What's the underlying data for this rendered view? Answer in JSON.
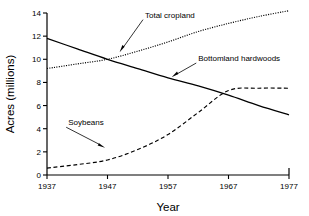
{
  "chart_data": {
    "type": "line",
    "title": "",
    "xlabel": "Year",
    "ylabel": "Acres (millions)",
    "xlim": [
      1937,
      1977
    ],
    "ylim": [
      0,
      14
    ],
    "xticks": [
      1937,
      1947,
      1957,
      1967,
      1977
    ],
    "yticks": [
      0,
      2,
      4,
      6,
      8,
      10,
      12,
      14
    ],
    "grid": false,
    "legend": "none (inline annotations with leader arrows)",
    "x": [
      1937,
      1942,
      1947,
      1952,
      1957,
      1962,
      1967,
      1972,
      1977
    ],
    "series": [
      {
        "name": "Total cropland",
        "style": "dotted",
        "values": [
          9.2,
          9.6,
          10.0,
          10.7,
          11.5,
          12.4,
          13.1,
          13.7,
          14.2
        ]
      },
      {
        "name": "Bottomland hardwoods",
        "style": "solid",
        "values": [
          11.8,
          10.9,
          10.0,
          9.2,
          8.4,
          7.7,
          6.9,
          6.0,
          5.2
        ]
      },
      {
        "name": "Soybeans",
        "style": "dashed",
        "values": [
          0.6,
          0.9,
          1.3,
          2.2,
          3.5,
          5.4,
          7.3,
          7.5,
          7.5
        ]
      }
    ],
    "annotations": [
      {
        "label": "Total cropland",
        "label_x": 1953.2,
        "label_y": 13.6,
        "point_x": 1949.0,
        "point_y": 10.6
      },
      {
        "label": "Bottomland hardwoods",
        "label_x": 1962.0,
        "label_y": 9.85,
        "point_x": 1957.6,
        "point_y": 8.45
      },
      {
        "label": "Soybeans",
        "label_x": 1940.5,
        "label_y": 4.3,
        "point_x": 1946.6,
        "point_y": 2.35
      }
    ],
    "colors": {
      "axis": "#000000",
      "series": "#000000",
      "background": "#ffffff"
    }
  },
  "axes": {
    "x_title": "Year",
    "y_title": "Acres (millions)",
    "x_tick_labels": [
      "1937",
      "1947",
      "1957",
      "1967",
      "1977"
    ],
    "y_tick_labels": [
      "0",
      "2",
      "4",
      "6",
      "8",
      "10",
      "12",
      "14"
    ]
  },
  "annotation_labels": {
    "total_cropland": "Total cropland",
    "bottomland_hardwoods": "Bottomland hardwoods",
    "soybeans": "Soybeans"
  }
}
